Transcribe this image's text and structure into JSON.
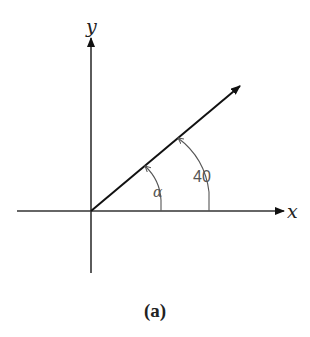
{
  "diagram": {
    "axes": {
      "x_label": "x",
      "y_label": "y"
    },
    "vector": {
      "description": "ray from origin at angle"
    },
    "angles": [
      {
        "label": "α",
        "meaning": "angle alpha between x-axis and vector"
      },
      {
        "label": "40",
        "meaning": "angle of 40 between x-axis and vector"
      }
    ],
    "caption": "(a)"
  }
}
